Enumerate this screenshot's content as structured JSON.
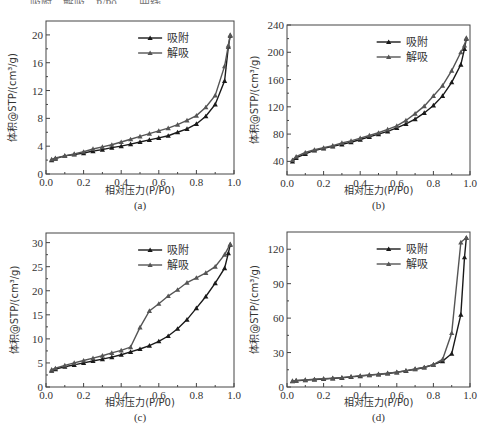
{
  "page": {
    "top_caption_fragment": "……吸附、解吸…P/P0……曲线……"
  },
  "chart_data": [
    {
      "id": "a",
      "type": "line",
      "caption": "(a)",
      "xlabel": "相对压力(P/P0)",
      "ylabel": "体积@STP/(cm³/g)",
      "xlim": [
        0.0,
        1.0
      ],
      "ylim": [
        0,
        22
      ],
      "xticks": [
        "0.0",
        "0.2",
        "0.4",
        "0.6",
        "0.8",
        "1.0"
      ],
      "yticks": [
        0,
        4,
        8,
        12,
        16,
        20
      ],
      "legend": [
        "吸附",
        "解吸"
      ],
      "legend_position": "upper-center-right",
      "grid": false,
      "series": [
        {
          "name": "吸附",
          "marker": "triangle-filled",
          "color": "#1a1a1a",
          "x": [
            0.03,
            0.05,
            0.1,
            0.15,
            0.2,
            0.25,
            0.3,
            0.35,
            0.4,
            0.45,
            0.5,
            0.55,
            0.6,
            0.65,
            0.7,
            0.75,
            0.8,
            0.85,
            0.9,
            0.95,
            0.97,
            0.98
          ],
          "y": [
            2.0,
            2.2,
            2.6,
            2.8,
            3.0,
            3.3,
            3.5,
            3.8,
            4.0,
            4.3,
            4.6,
            4.9,
            5.2,
            5.5,
            6.0,
            6.5,
            7.2,
            8.3,
            10.0,
            13.4,
            18.3,
            19.9
          ]
        },
        {
          "name": "解吸",
          "marker": "triangle-filled",
          "color": "#555555",
          "x": [
            0.98,
            0.97,
            0.95,
            0.9,
            0.85,
            0.8,
            0.75,
            0.7,
            0.65,
            0.6,
            0.55,
            0.5,
            0.45,
            0.4,
            0.35,
            0.3,
            0.25,
            0.2,
            0.15,
            0.1,
            0.05,
            0.03
          ],
          "y": [
            20.0,
            18.5,
            15.5,
            11.3,
            9.6,
            8.4,
            7.7,
            7.1,
            6.6,
            6.2,
            5.8,
            5.4,
            5.0,
            4.6,
            4.2,
            3.9,
            3.6,
            3.2,
            2.9,
            2.6,
            2.3,
            2.1
          ]
        }
      ]
    },
    {
      "id": "b",
      "type": "line",
      "caption": "(b)",
      "xlabel": "相对压力(P/P0)",
      "ylabel": "体积@STP/(cm³/g)",
      "xlim": [
        0.0,
        1.0
      ],
      "ylim": [
        20,
        240
      ],
      "xticks": [
        "0.0",
        "0.2",
        "0.4",
        "0.6",
        "0.8",
        "1.0"
      ],
      "yticks": [
        40,
        80,
        120,
        160,
        200,
        240
      ],
      "legend": [
        "吸附",
        "解吸"
      ],
      "legend_position": "upper-center-right",
      "grid": false,
      "series": [
        {
          "name": "吸附",
          "marker": "triangle-filled",
          "color": "#1a1a1a",
          "x": [
            0.03,
            0.05,
            0.1,
            0.15,
            0.2,
            0.25,
            0.3,
            0.35,
            0.4,
            0.45,
            0.5,
            0.55,
            0.6,
            0.65,
            0.7,
            0.75,
            0.8,
            0.85,
            0.9,
            0.95,
            0.97,
            0.98
          ],
          "y": [
            40,
            45,
            51,
            56,
            59,
            62,
            65,
            68,
            72,
            76,
            80,
            84,
            89,
            95,
            102,
            111,
            122,
            136,
            156,
            182,
            205,
            220
          ]
        },
        {
          "name": "解吸",
          "marker": "triangle-filled",
          "color": "#555555",
          "x": [
            0.98,
            0.97,
            0.95,
            0.9,
            0.85,
            0.8,
            0.75,
            0.7,
            0.65,
            0.6,
            0.55,
            0.5,
            0.45,
            0.4,
            0.35,
            0.3,
            0.25,
            0.2,
            0.15,
            0.1,
            0.05,
            0.03
          ],
          "y": [
            221,
            210,
            200,
            173,
            151,
            136,
            121,
            110,
            100,
            92,
            87,
            82,
            78,
            74,
            70,
            67,
            63,
            60,
            57,
            53,
            47,
            42
          ]
        }
      ]
    },
    {
      "id": "c",
      "type": "line",
      "caption": "(c)",
      "xlabel": "相对压力(P/P0)",
      "ylabel": "体积@STP/(cm³/g)",
      "xlim": [
        0.0,
        1.0
      ],
      "ylim": [
        0,
        32
      ],
      "xticks": [
        "0.0",
        "0.2",
        "0.4",
        "0.6",
        "0.8",
        "1.0"
      ],
      "yticks": [
        0,
        5,
        10,
        15,
        20,
        25,
        30
      ],
      "legend": [
        "吸附",
        "解吸"
      ],
      "legend_position": "upper-center-right",
      "grid": false,
      "series": [
        {
          "name": "吸附",
          "marker": "triangle-filled",
          "color": "#1a1a1a",
          "x": [
            0.03,
            0.05,
            0.1,
            0.15,
            0.2,
            0.25,
            0.3,
            0.35,
            0.4,
            0.45,
            0.5,
            0.55,
            0.6,
            0.65,
            0.7,
            0.75,
            0.8,
            0.85,
            0.9,
            0.95,
            0.97,
            0.98
          ],
          "y": [
            3.4,
            3.7,
            4.2,
            4.6,
            5.0,
            5.4,
            5.8,
            6.2,
            6.7,
            7.3,
            7.9,
            8.6,
            9.5,
            10.6,
            12.1,
            14.0,
            16.4,
            18.8,
            21.6,
            24.7,
            27.8,
            29.6
          ]
        },
        {
          "name": "解吸",
          "marker": "triangle-filled",
          "color": "#555555",
          "x": [
            0.98,
            0.95,
            0.9,
            0.85,
            0.8,
            0.75,
            0.7,
            0.65,
            0.6,
            0.55,
            0.5,
            0.45,
            0.4,
            0.35,
            0.3,
            0.25,
            0.2,
            0.15,
            0.1,
            0.05,
            0.03
          ],
          "y": [
            29.7,
            27.5,
            25.0,
            23.7,
            22.7,
            21.7,
            20.2,
            18.9,
            17.3,
            15.8,
            12.4,
            8.3,
            7.6,
            7.1,
            6.5,
            6.0,
            5.5,
            5.0,
            4.5,
            3.9,
            3.6
          ]
        }
      ]
    },
    {
      "id": "d",
      "type": "line",
      "caption": "(d)",
      "xlabel": "相对压力(P/P0)",
      "ylabel": "体积@STP/(cm³/g)",
      "xlim": [
        0.0,
        1.0
      ],
      "ylim": [
        0,
        135
      ],
      "xticks": [
        "0.0",
        "0.2",
        "0.4",
        "0.6",
        "0.8",
        "1.0"
      ],
      "yticks": [
        0,
        30,
        60,
        90,
        120
      ],
      "legend": [
        "吸附",
        "解吸"
      ],
      "legend_position": "upper-center-right",
      "grid": false,
      "series": [
        {
          "name": "吸附",
          "marker": "triangle-filled",
          "color": "#1a1a1a",
          "x": [
            0.03,
            0.05,
            0.1,
            0.15,
            0.2,
            0.25,
            0.3,
            0.35,
            0.4,
            0.45,
            0.5,
            0.55,
            0.6,
            0.65,
            0.7,
            0.75,
            0.8,
            0.85,
            0.9,
            0.95,
            0.97,
            0.98
          ],
          "y": [
            5,
            5.5,
            6,
            6.5,
            7,
            7.5,
            8,
            8.8,
            9.5,
            10.3,
            11,
            11.8,
            12.8,
            14,
            15.5,
            17,
            19.5,
            22.5,
            29,
            63,
            113,
            130
          ]
        },
        {
          "name": "解吸",
          "marker": "triangle-filled",
          "color": "#555555",
          "x": [
            0.98,
            0.95,
            0.9,
            0.85,
            0.8,
            0.75,
            0.7,
            0.65,
            0.6,
            0.55,
            0.5,
            0.45,
            0.4,
            0.35,
            0.3,
            0.25,
            0.2,
            0.15,
            0.1,
            0.05,
            0.03
          ],
          "y": [
            130,
            126,
            47,
            24,
            19.5,
            17.2,
            15.7,
            14.2,
            13,
            12,
            11.2,
            10.5,
            9.8,
            9,
            8.2,
            7.7,
            7.2,
            6.7,
            6.2,
            5.7,
            5.3
          ]
        }
      ]
    }
  ],
  "panels_layout": [
    {
      "id": "a",
      "frame": [
        46,
        21,
        234,
        174
      ],
      "ylabel_x": 16,
      "xlabel_y": 194,
      "caption_y": 209
    },
    {
      "id": "b",
      "frame": [
        287,
        25,
        470,
        175
      ],
      "ylabel_x": 258,
      "xlabel_y": 194,
      "caption_y": 209
    },
    {
      "id": "c",
      "frame": [
        46,
        233,
        234,
        387
      ],
      "ylabel_x": 18,
      "xlabel_y": 406,
      "caption_y": 421
    },
    {
      "id": "d",
      "frame": [
        287,
        232,
        470,
        387
      ],
      "ylabel_x": 258,
      "xlabel_y": 406,
      "caption_y": 421
    }
  ]
}
